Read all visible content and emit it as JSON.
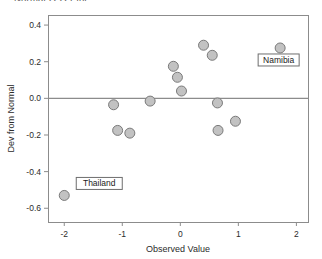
{
  "clipped_header": "Normal Q-Q Plot",
  "chart_data": {
    "type": "scatter",
    "title": "",
    "xlabel": "Observed Value",
    "ylabel": "Dev from Normal",
    "xlim": [
      -2.28,
      2.2
    ],
    "ylim": [
      -0.675,
      0.455
    ],
    "xticks": [
      -2,
      -1,
      0,
      1,
      2
    ],
    "xticklabels": [
      "-2",
      "-1",
      "0",
      "1",
      "2"
    ],
    "yticks": [
      0.4,
      0.2,
      0.0,
      -0.2,
      -0.4,
      -0.6
    ],
    "yticklabels": [
      "0.4",
      "0.2",
      "0.0",
      "-0.2",
      "-0.4",
      "-0.6"
    ],
    "grid": false,
    "legend": null,
    "reference_line": {
      "type": "horizontal",
      "y": 0.0
    },
    "marker": {
      "shape": "circle",
      "fill": "#c2c2c2",
      "edge": "#7a7a7a",
      "size": 5
    },
    "points": [
      {
        "x": -2.0,
        "y": -0.53,
        "label": "Thailand"
      },
      {
        "x": -1.15,
        "y": -0.035,
        "label": null
      },
      {
        "x": -1.08,
        "y": -0.175,
        "label": null
      },
      {
        "x": -0.87,
        "y": -0.19,
        "label": null
      },
      {
        "x": -0.52,
        "y": -0.015,
        "label": null
      },
      {
        "x": -0.12,
        "y": 0.175,
        "label": null
      },
      {
        "x": -0.05,
        "y": 0.115,
        "label": null
      },
      {
        "x": 0.02,
        "y": 0.04,
        "label": null
      },
      {
        "x": 0.4,
        "y": 0.29,
        "label": null
      },
      {
        "x": 0.55,
        "y": 0.235,
        "label": null
      },
      {
        "x": 0.64,
        "y": -0.025,
        "label": null
      },
      {
        "x": 0.65,
        "y": -0.175,
        "label": null
      },
      {
        "x": 0.95,
        "y": -0.125,
        "label": null
      },
      {
        "x": 1.72,
        "y": 0.275,
        "label": "Namibia"
      }
    ],
    "annotations": [
      {
        "text": "Thailand",
        "anchor_x": -2.0,
        "anchor_y": -0.53,
        "dx": 12,
        "dy": -12
      },
      {
        "text": "Namibia",
        "anchor_x": 1.72,
        "anchor_y": 0.275,
        "dx": -22,
        "dy": 12
      }
    ]
  }
}
